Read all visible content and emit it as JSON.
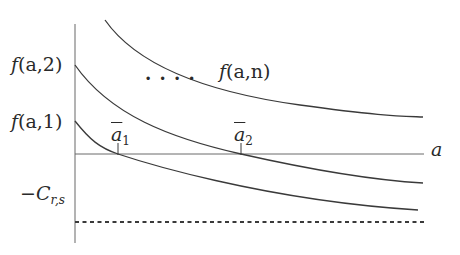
{
  "diagram": {
    "type": "function-curves",
    "axis": {
      "x_label": "a"
    },
    "y_labels": [
      {
        "id": "f-a-2",
        "fn": "f",
        "args": "(a,2)"
      },
      {
        "id": "f-a-1",
        "fn": "f",
        "args": "(a,1)"
      },
      {
        "id": "neg-c",
        "prefix": "−C",
        "sub": "r,s"
      }
    ],
    "curve_labels": {
      "f_a_n": {
        "fn": "f",
        "args": "(a,n)"
      }
    },
    "ellipsis": "· · · ·",
    "roots": [
      {
        "base": "a",
        "sub": "1"
      },
      {
        "base": "a",
        "sub": "2"
      }
    ],
    "curves": [
      {
        "name": "f(a,n)",
        "start": [
          105,
          20
        ],
        "end": [
          423,
          117
        ]
      },
      {
        "name": "f(a,2)",
        "start": [
          75,
          65
        ],
        "root_x": 241,
        "end": [
          423,
          183
        ]
      },
      {
        "name": "f(a,1)",
        "start": [
          75,
          121
        ],
        "root_x": 118,
        "end": [
          418,
          210
        ]
      }
    ],
    "asymptote": {
      "label": "−C_{r,s}",
      "style": "dashed"
    },
    "colors": {
      "line": "#3a3a3a",
      "axis": "#6a6a6a",
      "text": "#2a2a2a"
    }
  }
}
